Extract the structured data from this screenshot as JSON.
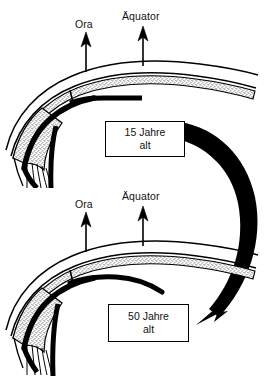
{
  "figure": {
    "type": "medical-diagram",
    "language": "de",
    "background_color": "#ffffff",
    "ink_color": "#000000",
    "stipple_color": "#b9b9b9"
  },
  "panels": [
    {
      "id": "panel-15",
      "age_box": {
        "line1": "15 Jahre",
        "line2": "alt"
      },
      "callouts": [
        {
          "id": "ora-upper",
          "label": "Ora",
          "arrow": "up-arrow-icon"
        },
        {
          "id": "aequator-upper",
          "label": "Äquator",
          "arrow": "up-arrow-icon"
        }
      ]
    },
    {
      "id": "panel-50",
      "age_box": {
        "line1": "50 Jahre",
        "line2": "alt"
      },
      "callouts": [
        {
          "id": "ora-lower",
          "label": "Ora",
          "arrow": "up-arrow-icon"
        },
        {
          "id": "aequator-lower",
          "label": "Äquator",
          "arrow": "up-arrow-icon"
        }
      ]
    }
  ],
  "progression_arrow": {
    "id": "aging-progression-arrow",
    "shape": "curved-arrow-icon",
    "direction": "from 15 Jahre alt panel to 50 Jahre alt panel",
    "color": "#000000"
  }
}
